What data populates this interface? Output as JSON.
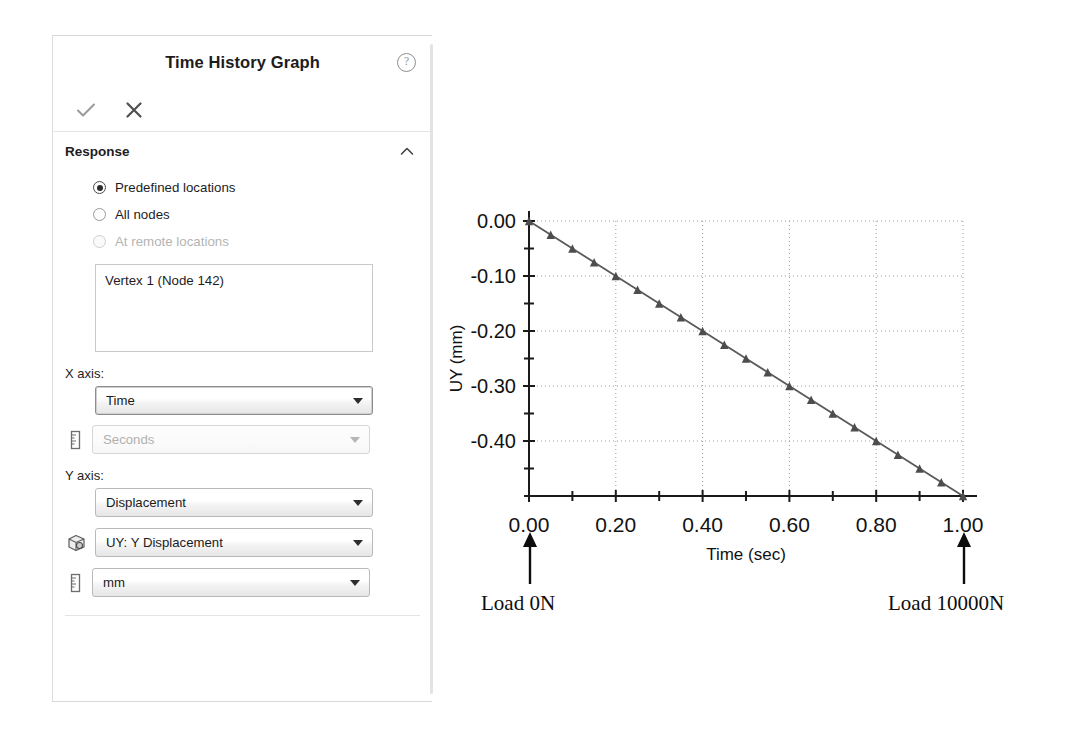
{
  "panel": {
    "title": "Time History Graph",
    "help_icon": "help-question-icon",
    "toolbar": {
      "accept_label": "accept-check",
      "cancel_label": "cancel-cross"
    },
    "sections": [
      {
        "title": "Response",
        "collapse_state": "expanded",
        "radios": [
          {
            "label": "Predefined locations",
            "selected": true,
            "disabled": false
          },
          {
            "label": "All nodes",
            "selected": false,
            "disabled": false
          },
          {
            "label": "At remote locations",
            "selected": false,
            "disabled": true
          }
        ],
        "listbox": {
          "items": [
            "Vertex 1 (Node 142)"
          ]
        },
        "fields": [
          {
            "label": "X axis:",
            "combos": [
              {
                "value": "Time",
                "disabled": false,
                "focused": true,
                "icon": null
              },
              {
                "value": "Seconds",
                "disabled": true,
                "focused": false,
                "icon": "ruler-icon"
              }
            ]
          },
          {
            "label": "Y axis:",
            "combos": [
              {
                "value": "Displacement",
                "disabled": false,
                "focused": false,
                "icon": null
              },
              {
                "value": "UY: Y Displacement",
                "disabled": false,
                "focused": false,
                "icon": "cube-icon"
              },
              {
                "value": "mm",
                "disabled": false,
                "focused": false,
                "icon": "ruler-icon"
              }
            ]
          }
        ]
      }
    ]
  },
  "chart_data": {
    "type": "line",
    "title": "",
    "xlabel": "Time (sec)",
    "ylabel": "UY (mm)",
    "xlim": [
      0.0,
      1.0
    ],
    "ylim": [
      -0.5,
      0.0
    ],
    "xticks": [
      "0.00",
      "0.20",
      "0.40",
      "0.60",
      "0.80",
      "1.00"
    ],
    "xtick_values": [
      0.0,
      0.2,
      0.4,
      0.6,
      0.8,
      1.0
    ],
    "xminor_step": 0.1,
    "yticks": [
      "0.00",
      "-0.10",
      "-0.20",
      "-0.30",
      "-0.40"
    ],
    "ytick_values": [
      0.0,
      -0.1,
      -0.2,
      -0.3,
      -0.4
    ],
    "yminor_step": 0.05,
    "grid": true,
    "grid_style": "dotted",
    "legend": "none",
    "marker": "triangle",
    "line_color": "#595959",
    "marker_color": "#4d4d4d",
    "x": [
      0.0,
      0.05,
      0.1,
      0.15,
      0.2,
      0.25,
      0.3,
      0.35,
      0.4,
      0.45,
      0.5,
      0.55,
      0.6,
      0.65,
      0.7,
      0.75,
      0.8,
      0.85,
      0.9,
      0.95,
      1.0
    ],
    "y": [
      0.0,
      -0.025,
      -0.05,
      -0.075,
      -0.1,
      -0.125,
      -0.15,
      -0.175,
      -0.2,
      -0.225,
      -0.25,
      -0.275,
      -0.3,
      -0.325,
      -0.35,
      -0.375,
      -0.4,
      -0.425,
      -0.45,
      -0.475,
      -0.5
    ]
  },
  "annotations": {
    "left": {
      "text": "Load 0N",
      "arrow": "up-arrow-icon",
      "at_x": 0.0
    },
    "right": {
      "text": "Load 10000N",
      "arrow": "up-arrow-icon",
      "at_x": 1.0
    }
  }
}
